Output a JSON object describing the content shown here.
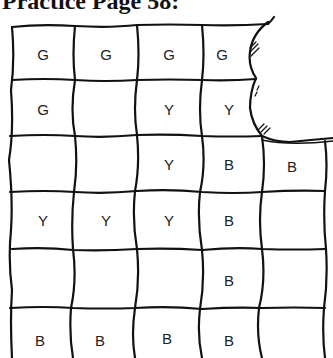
{
  "title": "Practice Page 58:",
  "grid": {
    "rows": [
      [
        "G",
        "G",
        "G",
        "G",
        null
      ],
      [
        "G",
        "",
        "Y",
        "Y",
        null
      ],
      [
        "",
        "",
        "Y",
        "B",
        "B"
      ],
      [
        "Y",
        "Y",
        "Y",
        "B",
        ""
      ],
      [
        "",
        "",
        "",
        "B",
        ""
      ],
      [
        "B",
        "B",
        "B",
        "B",
        ""
      ]
    ],
    "legend_meaning": {
      "G": "G",
      "Y": "Y",
      "B": "B"
    }
  },
  "cells": [
    {
      "label": "G",
      "x": 43,
      "y": 54
    },
    {
      "label": "G",
      "x": 106,
      "y": 54
    },
    {
      "label": "G",
      "x": 169,
      "y": 54
    },
    {
      "label": "G",
      "x": 222,
      "y": 54
    },
    {
      "label": "G",
      "x": 43,
      "y": 109
    },
    {
      "label": "Y",
      "x": 169,
      "y": 109
    },
    {
      "label": "Y",
      "x": 229,
      "y": 109
    },
    {
      "label": "Y",
      "x": 169,
      "y": 164
    },
    {
      "label": "B",
      "x": 229,
      "y": 164
    },
    {
      "label": "B",
      "x": 292,
      "y": 166
    },
    {
      "label": "Y",
      "x": 43,
      "y": 220
    },
    {
      "label": "Y",
      "x": 106,
      "y": 220
    },
    {
      "label": "Y",
      "x": 169,
      "y": 220
    },
    {
      "label": "B",
      "x": 229,
      "y": 220
    },
    {
      "label": "B",
      "x": 229,
      "y": 280
    },
    {
      "label": "B",
      "x": 40,
      "y": 340
    },
    {
      "label": "B",
      "x": 100,
      "y": 340
    },
    {
      "label": "B",
      "x": 167,
      "y": 338
    },
    {
      "label": "B",
      "x": 229,
      "y": 340
    }
  ]
}
